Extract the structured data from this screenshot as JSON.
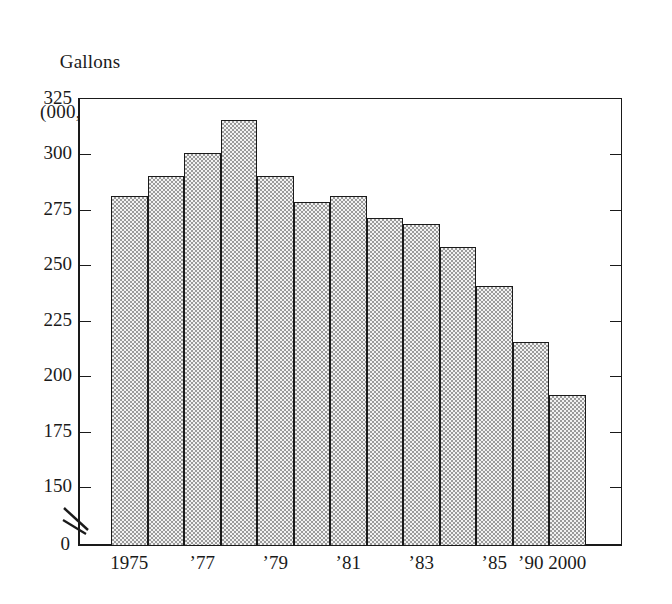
{
  "chart_data": {
    "type": "bar",
    "title": "Gallons (000,000)",
    "title_line1": "Gallons",
    "title_line2": "(000,000)",
    "xlabel": "",
    "ylabel": "Gallons (000,000)",
    "ylim": [
      150,
      325
    ],
    "y_axis_break": true,
    "y_axis_break_label": "0",
    "grid": false,
    "legend": null,
    "ytick_labels": [
      "325",
      "300",
      "275",
      "250",
      "225",
      "200",
      "175",
      "150"
    ],
    "ytick_values": [
      325,
      300,
      275,
      250,
      225,
      200,
      175,
      150
    ],
    "categories": [
      "1975",
      "1976",
      "1977",
      "1978",
      "1979",
      "1980",
      "1981",
      "1982",
      "1983",
      "1984",
      "1985",
      "1990",
      "2000"
    ],
    "xtick_labels": [
      "1975",
      "",
      "’77",
      "",
      "’79",
      "",
      "’81",
      "",
      "’83",
      "",
      "’85",
      "’90",
      "2000"
    ],
    "values": [
      281,
      290,
      300,
      315,
      290,
      278,
      281,
      271,
      268,
      258,
      240,
      215,
      191
    ],
    "bar_fill_color": "#dedede",
    "bar_edge_color": "#1a1a1a",
    "axis_color": "#1a1a1a",
    "background_color": "#ffffff"
  }
}
